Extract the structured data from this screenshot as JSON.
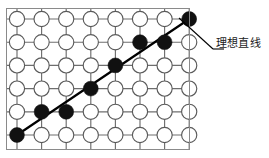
{
  "figure": {
    "title_visible": false,
    "annotation": {
      "label": "理想直线",
      "label_x": 216,
      "label_y": 44,
      "leader_from": [
        179,
        18
      ],
      "leader_to": [
        213,
        49
      ],
      "leader_dash_to": [
        224,
        49
      ]
    },
    "colors": {
      "filled_dot": "#111111",
      "open_dot_fill": "#ffffff",
      "dot_stroke": "#5a5a5a",
      "lattice_line": "#6e6e6e",
      "background_grid": "#d8dde2",
      "frame": "#8a8a8a",
      "ideal_line": "#000000",
      "text": "#1a1a1a",
      "page_background": "#ffffff"
    },
    "geometry": {
      "grid_left": 6,
      "grid_top": 8,
      "grid_right": 190,
      "grid_bottom": 150,
      "origin_x": 17,
      "origin_y": 19,
      "col_spacing": 24.6,
      "row_spacing": 23.2,
      "columns": 8,
      "rows": 6,
      "dot_radius": 7.6,
      "filled_dot_radius": 7.4,
      "background_grid_step": 12.3
    }
  },
  "chart_data": {
    "type": "scatter",
    "title": "",
    "xlabel": "",
    "ylabel": "",
    "columns": 8,
    "rows": 6,
    "row_order": "row 1 is topmost, row 6 is bottommost",
    "filled_dots": [
      {
        "col": 1,
        "row": 6
      },
      {
        "col": 2,
        "row": 5
      },
      {
        "col": 3,
        "row": 5
      },
      {
        "col": 4,
        "row": 4
      },
      {
        "col": 5,
        "row": 3
      },
      {
        "col": 6,
        "row": 2
      },
      {
        "col": 7,
        "row": 2
      },
      {
        "col": 8,
        "row": 1
      }
    ],
    "ideal_line": {
      "from": {
        "col": 1,
        "row": 6
      },
      "to": {
        "col": 8,
        "row": 1
      },
      "stroke_width": 2.2
    },
    "legend": [
      "理想直线"
    ],
    "grid": true
  }
}
